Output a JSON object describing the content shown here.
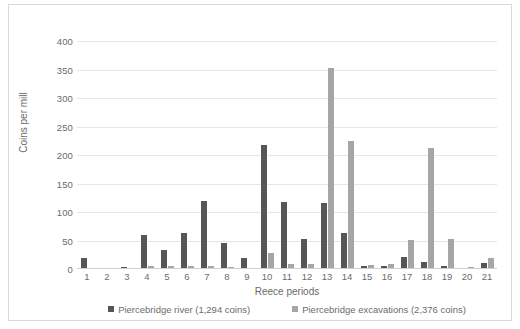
{
  "chart_data": {
    "type": "bar",
    "title": "",
    "xlabel": "Reece periods",
    "ylabel": "Coins per mill",
    "ylim": [
      0,
      400
    ],
    "yticks": [
      0,
      50,
      100,
      150,
      200,
      250,
      300,
      350,
      400
    ],
    "grid": true,
    "legend_position": "bottom",
    "categories": [
      "1",
      "2",
      "3",
      "4",
      "5",
      "6",
      "7",
      "8",
      "9",
      "10",
      "11",
      "12",
      "13",
      "14",
      "15",
      "16",
      "17",
      "18",
      "19",
      "20",
      "21"
    ],
    "series": [
      {
        "name": "Piercebridge river (1,294 coins)",
        "color": "#565656",
        "values": [
          20,
          1,
          3,
          59,
          33,
          64,
          119,
          45,
          19,
          218,
          118,
          52,
          115,
          63,
          6,
          5,
          21,
          12,
          6,
          2,
          11
        ]
      },
      {
        "name": "Piercebridge excavations (2,376 coins)",
        "color": "#a6a6a6",
        "values": [
          0,
          2,
          0,
          5,
          5,
          5,
          5,
          4,
          2,
          28,
          8,
          8,
          353,
          224,
          7,
          8,
          51,
          212,
          53,
          3,
          19
        ]
      }
    ]
  },
  "legend": {
    "items": [
      {
        "label": "Piercebridge river (1,294 coins)"
      },
      {
        "label": "Piercebridge excavations (2,376 coins)"
      }
    ]
  }
}
